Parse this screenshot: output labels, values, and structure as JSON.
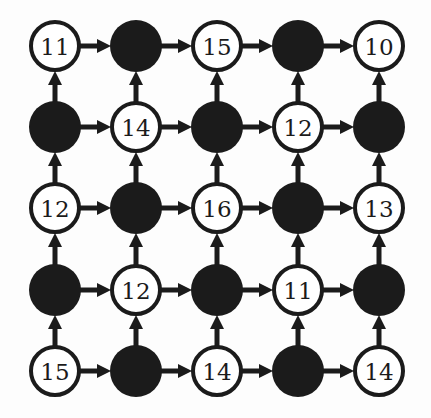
{
  "diagram": {
    "type": "directed-grid-graph",
    "rows": 5,
    "cols": 5,
    "colors": {
      "background": "#fdfdfd",
      "ink": "#1b1b1b",
      "open_fill": "#ffffff"
    },
    "edge_directions": [
      "right",
      "up"
    ],
    "nodes": [
      [
        {
          "filled": false,
          "label": "11"
        },
        {
          "filled": true,
          "label": ""
        },
        {
          "filled": false,
          "label": "15"
        },
        {
          "filled": true,
          "label": ""
        },
        {
          "filled": false,
          "label": "10"
        }
      ],
      [
        {
          "filled": true,
          "label": ""
        },
        {
          "filled": false,
          "label": "14"
        },
        {
          "filled": true,
          "label": ""
        },
        {
          "filled": false,
          "label": "12"
        },
        {
          "filled": true,
          "label": ""
        }
      ],
      [
        {
          "filled": false,
          "label": "12"
        },
        {
          "filled": true,
          "label": ""
        },
        {
          "filled": false,
          "label": "16"
        },
        {
          "filled": true,
          "label": ""
        },
        {
          "filled": false,
          "label": "13"
        }
      ],
      [
        {
          "filled": true,
          "label": ""
        },
        {
          "filled": false,
          "label": "12"
        },
        {
          "filled": true,
          "label": ""
        },
        {
          "filled": false,
          "label": "11"
        },
        {
          "filled": true,
          "label": ""
        }
      ],
      [
        {
          "filled": false,
          "label": "15"
        },
        {
          "filled": true,
          "label": ""
        },
        {
          "filled": false,
          "label": "14"
        },
        {
          "filled": true,
          "label": ""
        },
        {
          "filled": false,
          "label": "14"
        }
      ]
    ]
  }
}
